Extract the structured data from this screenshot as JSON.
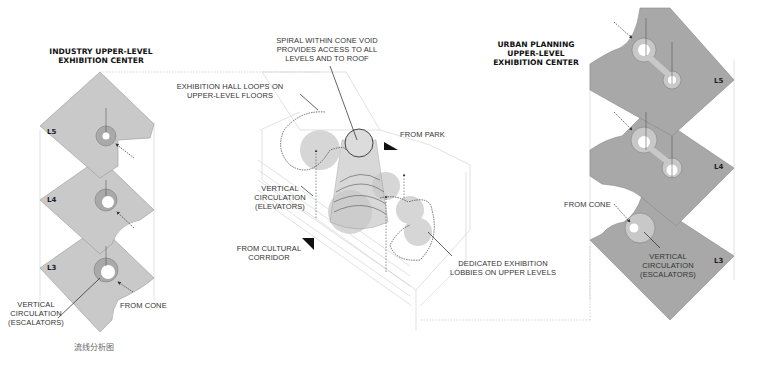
{
  "left_panel": {
    "title": "INDUSTRY UPPER-LEVEL\nEXHIBITION CENTER",
    "levels": [
      "L5",
      "L4",
      "L3"
    ],
    "labels": {
      "vertical_circulation": "VERTICAL\nCIRCULATION\n(ESCALATORS)",
      "from_cone": "FROM CONE"
    },
    "plate_color": "#c9c9c9",
    "core_color": "#a9a9a9"
  },
  "center_panel": {
    "labels": {
      "spiral": "SPIRAL WITHIN CONE VOID\nPROVIDES ACCESS TO ALL\nLEVELS AND TO ROOF",
      "exhibition_hall": "EXHIBITION HALL LOOPS ON\nUPPER-LEVEL FLOORS",
      "from_park": "FROM PARK",
      "vertical_circulation": "VERTICAL\nCIRCULATION\n(ELEVATORS)",
      "from_cultural_corridor": "FROM CULTURAL\nCORRIDOR",
      "dedicated_lobbies": "DEDICATED EXHIBITION\nLOBBIES ON UPPER LEVELS"
    },
    "lobby_color": "#d2d2d2"
  },
  "right_panel": {
    "title": "URBAN PLANNING\nUPPER-LEVEL\nEXHIBITION CENTER",
    "levels": [
      "L5",
      "L4",
      "L3"
    ],
    "labels": {
      "from_cone": "FROM CONE",
      "vertical_circulation": "VERTICAL\nCIRCULATION\n(ESCALATORS)"
    },
    "plate_color": "#a8a8a8",
    "core_color": "#c8c8c8"
  },
  "caption": "流线分析图"
}
